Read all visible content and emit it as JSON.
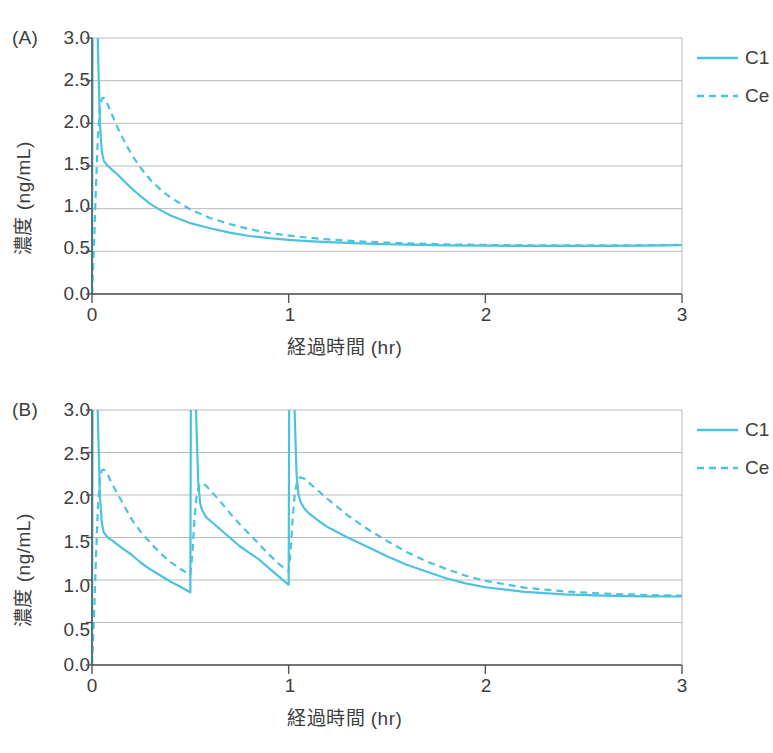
{
  "figure": {
    "panels": [
      {
        "id": "A",
        "label": "(A)",
        "xlabel": "経過時間 (hr)",
        "ylabel": "濃度 (ng/mL)",
        "yticks": [
          "3.0",
          "2.5",
          "2.0",
          "1.5",
          "1.0",
          "0.5",
          "0.0"
        ],
        "xticks": [
          "0",
          "1",
          "2",
          "3"
        ],
        "legend": [
          {
            "name": "C1",
            "style": "solid"
          },
          {
            "name": "Ce",
            "style": "dashed"
          }
        ]
      },
      {
        "id": "B",
        "label": "(B)",
        "xlabel": "経過時間 (hr)",
        "ylabel": "濃度 (ng/mL)",
        "yticks": [
          "3.0",
          "2.5",
          "2.0",
          "1.5",
          "1.0",
          "0.5",
          "0.0"
        ],
        "xticks": [
          "0",
          "1",
          "2",
          "3"
        ],
        "legend": [
          {
            "name": "C1",
            "style": "solid"
          },
          {
            "name": "Ce",
            "style": "dashed"
          }
        ]
      }
    ]
  },
  "colors": {
    "curve": "#4BC3DE",
    "grid": "#b9b9b9",
    "axis": "#555555",
    "text": "#3d3d3d"
  },
  "chart_data": [
    {
      "type": "line",
      "title": "(A)",
      "xlabel": "経過時間 (hr)",
      "ylabel": "濃度 (ng/mL)",
      "xlim": [
        0,
        3
      ],
      "ylim": [
        0,
        3
      ],
      "xticks": [
        0,
        1,
        2,
        3
      ],
      "yticks": [
        0.0,
        0.5,
        1.0,
        1.5,
        2.0,
        2.5,
        3.0
      ],
      "grid": true,
      "legend_position": "right",
      "annotation": "Single bolus dose at t=0 followed by continuous infusion; C1 = plasma (central) concentration, Ce = effect-site concentration",
      "series": [
        {
          "name": "C1",
          "style": "solid",
          "x": [
            0,
            0.005,
            0.01,
            0.015,
            0.02,
            0.025,
            0.03,
            0.04,
            0.05,
            0.06,
            0.08,
            0.1,
            0.13,
            0.16,
            0.2,
            0.25,
            0.3,
            0.35,
            0.4,
            0.5,
            0.6,
            0.7,
            0.8,
            0.9,
            1.0,
            1.1,
            1.2,
            1.3,
            1.4,
            1.5,
            1.6,
            1.8,
            2.0,
            2.2,
            2.4,
            2.6,
            2.8,
            3.0
          ],
          "y": [
            0,
            5.6,
            8.0,
            7.0,
            5.2,
            3.8,
            2.9,
            2.0,
            1.67,
            1.56,
            1.5,
            1.46,
            1.4,
            1.33,
            1.24,
            1.14,
            1.05,
            0.98,
            0.92,
            0.83,
            0.77,
            0.72,
            0.68,
            0.655,
            0.635,
            0.62,
            0.608,
            0.598,
            0.59,
            0.583,
            0.578,
            0.57,
            0.566,
            0.564,
            0.563,
            0.564,
            0.567,
            0.572
          ]
        },
        {
          "name": "Ce",
          "style": "dashed",
          "x": [
            0,
            0.01,
            0.02,
            0.03,
            0.04,
            0.05,
            0.06,
            0.07,
            0.08,
            0.1,
            0.13,
            0.16,
            0.2,
            0.25,
            0.3,
            0.35,
            0.4,
            0.5,
            0.6,
            0.7,
            0.8,
            0.9,
            1.0,
            1.1,
            1.2,
            1.3,
            1.4,
            1.5,
            1.6,
            1.8,
            2.0,
            2.2,
            2.4,
            2.6,
            2.8,
            3.0
          ],
          "y": [
            0,
            0.55,
            1.25,
            1.85,
            2.18,
            2.29,
            2.3,
            2.27,
            2.22,
            2.11,
            1.95,
            1.81,
            1.64,
            1.47,
            1.33,
            1.22,
            1.13,
            0.99,
            0.89,
            0.82,
            0.76,
            0.715,
            0.685,
            0.66,
            0.64,
            0.625,
            0.612,
            0.602,
            0.594,
            0.582,
            0.575,
            0.571,
            0.569,
            0.569,
            0.571,
            0.575
          ]
        }
      ]
    },
    {
      "type": "line",
      "title": "(B)",
      "xlabel": "経過時間 (hr)",
      "ylabel": "濃度 (ng/mL)",
      "xlim": [
        0,
        3
      ],
      "ylim": [
        0,
        3
      ],
      "xticks": [
        0,
        1,
        2,
        3
      ],
      "yticks": [
        0.0,
        0.5,
        1.0,
        1.5,
        2.0,
        2.5,
        3.0
      ],
      "grid": true,
      "legend_position": "right",
      "annotation": "Repeated bolus doses at t=0, 0.5 and 1.0 hr on top of infusion; C1 = plasma concentration, Ce = effect-site concentration",
      "dose_times": [
        0,
        0.5,
        1.0
      ],
      "series": [
        {
          "name": "C1",
          "style": "solid",
          "x": [
            0,
            0.005,
            0.01,
            0.015,
            0.02,
            0.025,
            0.03,
            0.04,
            0.05,
            0.06,
            0.08,
            0.1,
            0.15,
            0.2,
            0.25,
            0.3,
            0.35,
            0.4,
            0.45,
            0.499,
            0.5,
            0.505,
            0.51,
            0.515,
            0.52,
            0.525,
            0.53,
            0.54,
            0.55,
            0.56,
            0.58,
            0.6,
            0.65,
            0.7,
            0.75,
            0.8,
            0.85,
            0.9,
            0.95,
            0.999,
            1.0,
            1.005,
            1.01,
            1.015,
            1.02,
            1.025,
            1.03,
            1.04,
            1.05,
            1.06,
            1.08,
            1.1,
            1.15,
            1.2,
            1.3,
            1.4,
            1.5,
            1.6,
            1.7,
            1.8,
            1.9,
            2.0,
            2.2,
            2.4,
            2.6,
            2.8,
            3.0
          ],
          "y": [
            0,
            5.6,
            8.0,
            7.0,
            5.2,
            3.8,
            2.9,
            2.0,
            1.67,
            1.56,
            1.5,
            1.47,
            1.38,
            1.3,
            1.2,
            1.12,
            1.05,
            0.98,
            0.92,
            0.855,
            0.855,
            5.0,
            7.6,
            6.6,
            4.9,
            3.7,
            2.9,
            2.16,
            1.9,
            1.82,
            1.74,
            1.7,
            1.6,
            1.5,
            1.4,
            1.32,
            1.24,
            1.14,
            1.04,
            0.945,
            0.945,
            5.1,
            7.7,
            6.7,
            5.0,
            3.8,
            3.0,
            2.25,
            2.0,
            1.92,
            1.84,
            1.79,
            1.7,
            1.62,
            1.5,
            1.39,
            1.28,
            1.18,
            1.1,
            1.02,
            0.96,
            0.915,
            0.86,
            0.83,
            0.815,
            0.808,
            0.806
          ]
        },
        {
          "name": "Ce",
          "style": "dashed",
          "x": [
            0,
            0.01,
            0.02,
            0.03,
            0.04,
            0.05,
            0.06,
            0.08,
            0.1,
            0.15,
            0.2,
            0.25,
            0.3,
            0.35,
            0.4,
            0.45,
            0.5,
            0.51,
            0.52,
            0.53,
            0.54,
            0.55,
            0.56,
            0.58,
            0.6,
            0.65,
            0.7,
            0.75,
            0.8,
            0.85,
            0.9,
            0.95,
            1.0,
            1.01,
            1.02,
            1.03,
            1.04,
            1.05,
            1.06,
            1.08,
            1.1,
            1.15,
            1.2,
            1.3,
            1.4,
            1.5,
            1.6,
            1.7,
            1.8,
            1.9,
            2.0,
            2.2,
            2.4,
            2.6,
            2.8,
            3.0
          ],
          "y": [
            0,
            0.55,
            1.25,
            1.85,
            2.18,
            2.29,
            2.3,
            2.24,
            2.14,
            1.93,
            1.72,
            1.56,
            1.43,
            1.31,
            1.21,
            1.13,
            1.06,
            1.3,
            1.68,
            1.95,
            2.08,
            2.13,
            2.14,
            2.11,
            2.06,
            1.93,
            1.79,
            1.66,
            1.54,
            1.42,
            1.3,
            1.19,
            1.1,
            1.35,
            1.72,
            1.99,
            2.13,
            2.19,
            2.21,
            2.19,
            2.15,
            2.05,
            1.95,
            1.76,
            1.6,
            1.46,
            1.33,
            1.22,
            1.13,
            1.05,
            0.99,
            0.91,
            0.866,
            0.84,
            0.824,
            0.816
          ]
        }
      ]
    }
  ]
}
